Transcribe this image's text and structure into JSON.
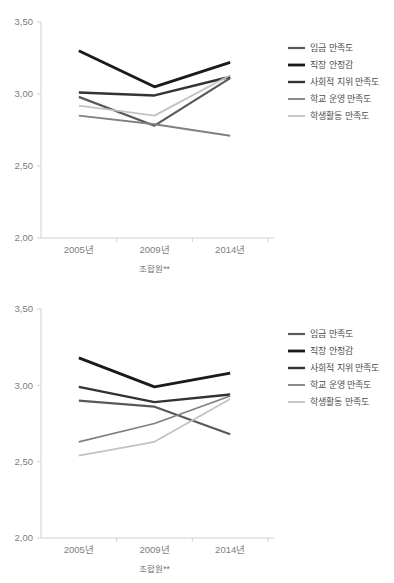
{
  "page": {
    "background": "#ffffff",
    "top_clipped_text": "",
    "width": 394,
    "height": 583
  },
  "palette": {
    "wage": "#595959",
    "job_security": "#1a1a1a",
    "social_status": "#333333",
    "school_mgmt": "#808080",
    "student_activity": "#c2c2c2",
    "axis": "#d0d0d0",
    "tick_text": "#7d7d7d",
    "legend_text": "#4d4d4d"
  },
  "charts": [
    {
      "id": "chart-top",
      "name": "union-member-satisfaction-top",
      "xtitle": "조합원**",
      "ylabel": "",
      "ytick_labels": [
        "3,50",
        "3,00",
        "2,50",
        "2,00"
      ],
      "ytick_values": [
        3.5,
        3.0,
        2.5,
        2.0
      ],
      "xtick_labels": [
        "2005년",
        "2009년",
        "2014년"
      ],
      "legend": [
        {
          "label": "임금 만족도",
          "color": "#595959",
          "width": 2.2
        },
        {
          "label": "직장 안정감",
          "color": "#1a1a1a",
          "width": 2.8
        },
        {
          "label": "사회적 지위 만족도",
          "color": "#333333",
          "width": 2.4
        },
        {
          "label": "학교 운영 만족도",
          "color": "#808080",
          "width": 1.8
        },
        {
          "label": "학생활동 만족도",
          "color": "#c2c2c2",
          "width": 1.8
        }
      ]
    },
    {
      "id": "chart-bottom",
      "name": "union-member-satisfaction-bottom",
      "xtitle": "조합원**",
      "ylabel": "",
      "ytick_labels": [
        "3,50",
        "3,00",
        "2,50",
        "2,00"
      ],
      "ytick_values": [
        3.5,
        3.0,
        2.5,
        2.0
      ],
      "xtick_labels": [
        "2005년",
        "2009년",
        "2014년"
      ],
      "legend": [
        {
          "label": "임금 만족도",
          "color": "#595959",
          "width": 2.2
        },
        {
          "label": "직장 안정감",
          "color": "#1a1a1a",
          "width": 2.8
        },
        {
          "label": "사회적 지위 만족도",
          "color": "#333333",
          "width": 2.4
        },
        {
          "label": "학교 운영 만족도",
          "color": "#808080",
          "width": 1.8
        },
        {
          "label": "학생활동 만족도",
          "color": "#c2c2c2",
          "width": 1.8
        }
      ]
    }
  ],
  "chart_data": [
    {
      "type": "line",
      "title": "",
      "subtitle": "",
      "xlabel": "조합원**",
      "ylabel": "",
      "categories": [
        "2005년",
        "2009년",
        "2014년"
      ],
      "ylim": [
        2.0,
        3.5
      ],
      "yticks": [
        2.0,
        2.5,
        3.0,
        3.5
      ],
      "ytick_labels": [
        "2,00",
        "2,50",
        "3,00",
        "3,50"
      ],
      "grid": false,
      "legend_position": "right",
      "series": [
        {
          "name": "임금 만족도",
          "color": "#595959",
          "values": [
            2.98,
            2.78,
            3.11
          ]
        },
        {
          "name": "직장 안정감",
          "color": "#1a1a1a",
          "values": [
            3.3,
            3.05,
            3.22
          ]
        },
        {
          "name": "사회적 지위 만족도",
          "color": "#333333",
          "values": [
            3.01,
            2.99,
            3.12
          ]
        },
        {
          "name": "학교 운영 만족도",
          "color": "#808080",
          "values": [
            2.85,
            2.79,
            2.71
          ]
        },
        {
          "name": "학생활동 만족도",
          "color": "#c2c2c2",
          "values": [
            2.92,
            2.85,
            3.13
          ]
        }
      ]
    },
    {
      "type": "line",
      "title": "",
      "subtitle": "",
      "xlabel": "조합원**",
      "ylabel": "",
      "categories": [
        "2005년",
        "2009년",
        "2014년"
      ],
      "ylim": [
        2.0,
        3.5
      ],
      "yticks": [
        2.0,
        2.5,
        3.0,
        3.5
      ],
      "ytick_labels": [
        "2,00",
        "2,50",
        "3,00",
        "3,50"
      ],
      "grid": false,
      "legend_position": "right",
      "series": [
        {
          "name": "임금 만족도",
          "color": "#595959",
          "values": [
            2.9,
            2.86,
            2.68
          ]
        },
        {
          "name": "직장 안정감",
          "color": "#1a1a1a",
          "values": [
            3.18,
            2.99,
            3.08
          ]
        },
        {
          "name": "사회적 지위 만족도",
          "color": "#333333",
          "values": [
            2.99,
            2.89,
            2.94
          ]
        },
        {
          "name": "학교 운영 만족도",
          "color": "#808080",
          "values": [
            2.63,
            2.75,
            2.93
          ]
        },
        {
          "name": "학생활동 만족도",
          "color": "#c2c2c2",
          "values": [
            2.54,
            2.63,
            2.91
          ]
        }
      ]
    }
  ]
}
